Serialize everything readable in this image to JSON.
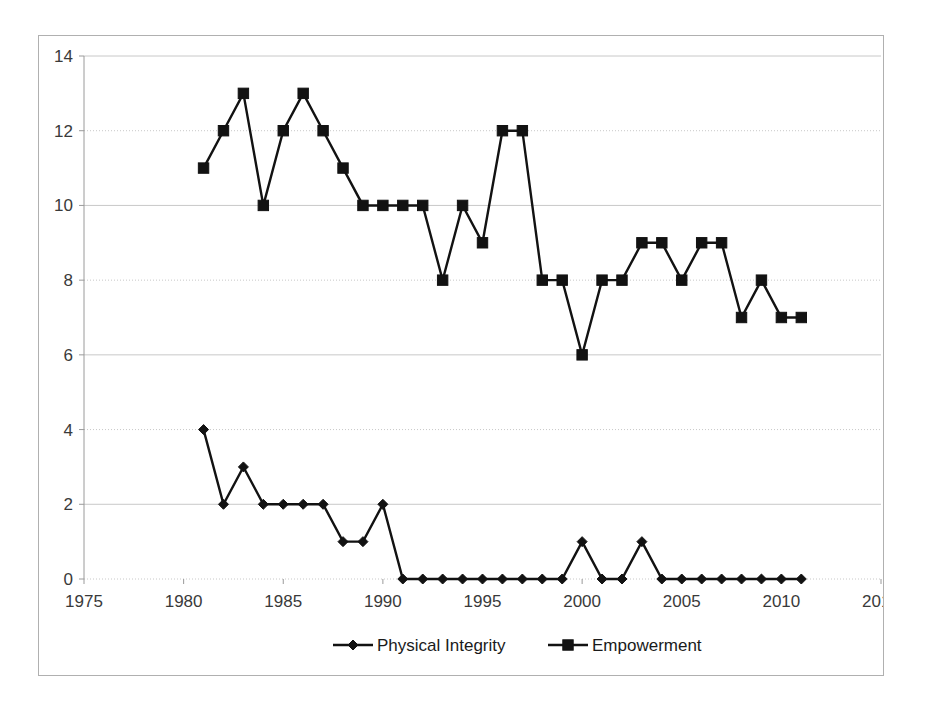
{
  "chart_data": {
    "type": "line",
    "title": "",
    "subtitle": "",
    "xlabel": "",
    "ylabel": "",
    "xlim": [
      1975,
      2015
    ],
    "ylim": [
      0,
      14
    ],
    "xticks": [
      1975,
      1980,
      1985,
      1990,
      1995,
      2000,
      2005,
      2010,
      2015
    ],
    "yticks": [
      0,
      2,
      4,
      6,
      8,
      10,
      12,
      14
    ],
    "grid": true,
    "grid_axis": "y",
    "legend_position": "bottom",
    "x": [
      1981,
      1982,
      1983,
      1984,
      1985,
      1986,
      1987,
      1988,
      1989,
      1990,
      1991,
      1992,
      1993,
      1994,
      1995,
      1996,
      1997,
      1998,
      1999,
      2000,
      2001,
      2002,
      2003,
      2004,
      2005,
      2006,
      2007,
      2008,
      2009,
      2010,
      2011
    ],
    "series": [
      {
        "name": "Physical Integrity",
        "marker": "diamond",
        "color": "#121212",
        "values": [
          4,
          2,
          3,
          2,
          2,
          2,
          2,
          1,
          1,
          2,
          0,
          0,
          0,
          0,
          0,
          0,
          0,
          0,
          0,
          1,
          0,
          0,
          1,
          0,
          0,
          0,
          0,
          0,
          0,
          0,
          0
        ]
      },
      {
        "name": "Empowerment",
        "marker": "square",
        "color": "#121212",
        "values": [
          11,
          12,
          13,
          10,
          12,
          13,
          12,
          11,
          10,
          10,
          10,
          10,
          8,
          10,
          9,
          12,
          12,
          8,
          8,
          6,
          8,
          8,
          9,
          9,
          8,
          9,
          9,
          7,
          8,
          7,
          7
        ]
      }
    ]
  },
  "legend": {
    "items": [
      {
        "label": "Physical Integrity",
        "marker": "diamond"
      },
      {
        "label": "Empowerment",
        "marker": "square"
      }
    ]
  },
  "colors": {
    "series": "#121212",
    "gridline": "#c8c8c8",
    "axis": "#9a9a9a",
    "frame": "#b0b0b0",
    "tick_text": "#3a3a3a",
    "background": "#ffffff"
  }
}
